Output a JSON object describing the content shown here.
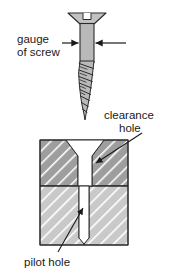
{
  "diagram": {
    "labels": {
      "gauge_line1": "gauge",
      "gauge_line2": "of screw",
      "clearance_line1": "clearance",
      "clearance_line2": "hole",
      "pilot": "pilot hole"
    },
    "colors": {
      "background": "#ffffff",
      "screw_fill": "#b9b9b9",
      "screw_head_fill": "#c2c2c2",
      "outline": "#2b2b2b",
      "upper_block_fill": "#9e9e9e",
      "lower_block_fill": "#c9c9c9",
      "hatch_stroke": "#ffffff",
      "hole_fill": "#ffffff",
      "text": "#1a1a1a",
      "leader": "#1a1a1a"
    },
    "screw": {
      "head_type": "countersunk-slotted",
      "head_left_x": 68,
      "head_right_x": 106,
      "head_top_y": 13,
      "shank_left_x": 80,
      "shank_right_x": 94,
      "shank_top_y": 24,
      "thread_start_y": 61,
      "tip_y": 120,
      "thread_turns": 7
    },
    "blocks": {
      "left_x": 40,
      "right_x": 128,
      "upper_top_y": 140,
      "divider_y": 186,
      "bottom_y": 245
    },
    "holes": {
      "clearance_left_x": 78,
      "clearance_right_x": 92,
      "countersink_top_left_x": 66,
      "countersink_top_right_x": 104,
      "countersink_depth_y": 156,
      "pilot_left_x": 79,
      "pilot_right_x": 89,
      "pilot_bottom_y": 238
    },
    "gauge_arrows": {
      "left_line_start_x": 62,
      "right_line_end_x": 126,
      "y": 43
    }
  }
}
